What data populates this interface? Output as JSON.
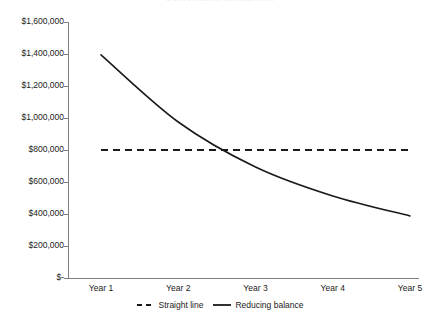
{
  "chart_data": {
    "type": "line",
    "title": "Depreciation comparison",
    "xlabel": "",
    "ylabel": "",
    "categories": [
      "Year 1",
      "Year 2",
      "Year 3",
      "Year 4",
      "Year 5"
    ],
    "series": [
      {
        "name": "Straight line",
        "style": "dashed",
        "color": "#1a1a1a",
        "values": [
          800000,
          800000,
          800000,
          800000,
          800000
        ]
      },
      {
        "name": "Reducing balance",
        "style": "solid",
        "color": "#1a1a1a",
        "values": [
          1395000,
          975000,
          694000,
          513000,
          388000
        ]
      }
    ],
    "ylim": [
      0,
      1600000
    ],
    "ytick_values": [
      1600000,
      1400000,
      1200000,
      1000000,
      800000,
      600000,
      400000,
      200000,
      0
    ],
    "ytick_labels": [
      "$1,600,000",
      "$1,400,000",
      "$1,200,000",
      "$1,000,000",
      "$800,000",
      "$600,000",
      "$400,000",
      "$200,000",
      "$-"
    ],
    "grid": false,
    "legend_position": "bottom",
    "legend": [
      "Straight line",
      "Reducing balance"
    ],
    "axis_color": "#808080"
  }
}
